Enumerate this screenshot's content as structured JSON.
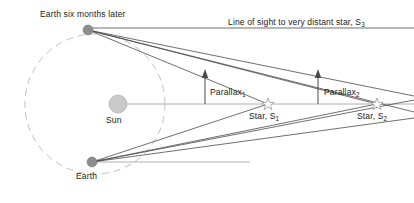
{
  "diagram": {
    "colors": {
      "line": "#4a4a4a",
      "orbit_dashed": "#b9b9b9",
      "sun_fill": "#c9c9c9",
      "sun_stroke": "#b0b0b0",
      "earth_fill": "#8c8c8c",
      "star_stroke": "#9a9a9a",
      "text": "#1a1a1a",
      "background": "#ffffff"
    },
    "labels": {
      "earth_six_months_later": "Earth six months later",
      "line_of_sight": "Line of sight to very distant star, S",
      "line_of_sight_sub": "3",
      "sun": "Sun",
      "earth": "Earth",
      "parallax_1": "Parallax",
      "parallax_1_sub": "1",
      "parallax_2": "Parallax",
      "parallax_2_sub": "2",
      "star_s1": "Star, S",
      "star_s1_sub": "1",
      "star_s2": "Star, S",
      "star_s2_sub": "2"
    },
    "geometry": {
      "orbit": {
        "cx": 95,
        "cy": 104,
        "r": 70,
        "dashed": true
      },
      "sun": {
        "cx": 118,
        "cy": 104,
        "r": 9
      },
      "earth_top": {
        "cx": 88,
        "cy": 30,
        "r": 5
      },
      "earth_bottom": {
        "cx": 92,
        "cy": 162,
        "r": 5
      },
      "star_s1": {
        "cx": 268,
        "cy": 104,
        "r": 5
      },
      "star_s2": {
        "cx": 377,
        "cy": 104,
        "r": 5
      },
      "axis_y": 104,
      "top_sightline_y": 28,
      "parallax_arrow_1_x": 205,
      "parallax_arrow_2_x": 318
    }
  }
}
